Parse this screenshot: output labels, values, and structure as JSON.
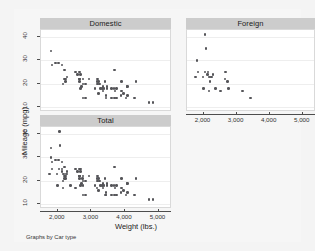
{
  "chart_data": {
    "type": "scatter",
    "title": "",
    "xlabel": "Weight (lbs.)",
    "ylabel": "Mileage (mpg)",
    "note": "Graphs by Car type",
    "xlim": [
      1500,
      5400
    ],
    "ylim": [
      8,
      43
    ],
    "xticks": [
      2000,
      3000,
      4000,
      5000
    ],
    "xticklabels": [
      "2,000",
      "3,000",
      "4,000",
      "5,000"
    ],
    "yticks": [
      10,
      20,
      30,
      40
    ],
    "yticklabels": [
      "10",
      "20",
      "30",
      "40"
    ],
    "grid": "horizontal",
    "legend": "none",
    "marker_color": "#555559",
    "panel_header_color": "#cccccc",
    "plot_background": "#ffffff",
    "graph_background": "#f6f6f6",
    "panels": [
      {
        "label": "Domestic",
        "points": [
          [
            2930,
            22
          ],
          [
            3350,
            17
          ],
          [
            2640,
            22
          ],
          [
            3250,
            20
          ],
          [
            4080,
            15
          ],
          [
            3670,
            18
          ],
          [
            3690,
            26
          ],
          [
            3180,
            20
          ],
          [
            3220,
            16
          ],
          [
            4060,
            19
          ],
          [
            3600,
            14
          ],
          [
            3740,
            14
          ],
          [
            4840,
            12
          ],
          [
            4720,
            12
          ],
          [
            3430,
            15
          ],
          [
            3280,
            18
          ],
          [
            2750,
            14
          ],
          [
            3430,
            14
          ],
          [
            3210,
            21
          ],
          [
            2020,
            29
          ],
          [
            2280,
            23
          ],
          [
            2750,
            20
          ],
          [
            3170,
            21
          ],
          [
            2710,
            19
          ],
          [
            2200,
            22
          ],
          [
            2670,
            24
          ],
          [
            3690,
            14
          ],
          [
            3400,
            21
          ],
          [
            2520,
            25
          ],
          [
            3330,
            18
          ],
          [
            3370,
            18
          ],
          [
            3600,
            18
          ],
          [
            3740,
            18
          ],
          [
            3700,
            17
          ],
          [
            3950,
            16
          ],
          [
            3470,
            18
          ],
          [
            2830,
            14
          ],
          [
            2640,
            22
          ],
          [
            2230,
            21
          ],
          [
            2130,
            28
          ],
          [
            2650,
            25
          ],
          [
            2750,
            22
          ],
          [
            3470,
            19
          ],
          [
            3880,
            15
          ],
          [
            3900,
            17
          ],
          [
            4290,
            14
          ],
          [
            4030,
            14
          ],
          [
            3180,
            22
          ],
          [
            2830,
            20
          ],
          [
            2200,
            26
          ],
          [
            1800,
            34
          ],
          [
            2670,
            18
          ],
          [
            3900,
            21
          ],
          [
            4330,
            21
          ],
          [
            2160,
            20
          ],
          [
            2580,
            24
          ],
          [
            1930,
            29
          ],
          [
            1830,
            28
          ],
          [
            3110,
            18
          ],
          [
            4070,
            19
          ],
          [
            2230,
            22
          ],
          [
            2640,
            21
          ],
          [
            3350,
            19
          ]
        ]
      },
      {
        "label": "Foreign",
        "points": [
          [
            2070,
            35
          ],
          [
            2130,
            25
          ],
          [
            2650,
            22
          ],
          [
            2160,
            17
          ],
          [
            1760,
            23
          ],
          [
            2040,
            25
          ],
          [
            2050,
            41
          ],
          [
            1830,
            25
          ],
          [
            2200,
            21
          ],
          [
            2670,
            25
          ],
          [
            1990,
            18
          ],
          [
            2160,
            23
          ],
          [
            2370,
            18
          ],
          [
            2280,
            24
          ],
          [
            2750,
            18
          ],
          [
            2120,
            24
          ],
          [
            2240,
            23
          ],
          [
            2520,
            17
          ],
          [
            1980,
            23
          ],
          [
            1800,
            30
          ],
          [
            3170,
            17
          ],
          [
            2190,
            23
          ],
          [
            3420,
            14
          ],
          [
            2730,
            21
          ]
        ]
      },
      {
        "label": "Total",
        "points": [
          [
            2930,
            22
          ],
          [
            3350,
            17
          ],
          [
            2640,
            22
          ],
          [
            3250,
            20
          ],
          [
            4080,
            15
          ],
          [
            3670,
            18
          ],
          [
            3690,
            26
          ],
          [
            3180,
            20
          ],
          [
            3220,
            16
          ],
          [
            4060,
            19
          ],
          [
            3600,
            14
          ],
          [
            3740,
            14
          ],
          [
            4840,
            12
          ],
          [
            4720,
            12
          ],
          [
            3430,
            15
          ],
          [
            3280,
            18
          ],
          [
            2750,
            14
          ],
          [
            3430,
            14
          ],
          [
            3210,
            21
          ],
          [
            2020,
            29
          ],
          [
            2280,
            23
          ],
          [
            2750,
            20
          ],
          [
            3170,
            21
          ],
          [
            2710,
            19
          ],
          [
            2200,
            22
          ],
          [
            2670,
            24
          ],
          [
            3690,
            14
          ],
          [
            3400,
            21
          ],
          [
            2520,
            25
          ],
          [
            3330,
            18
          ],
          [
            3370,
            18
          ],
          [
            3600,
            18
          ],
          [
            3740,
            18
          ],
          [
            3700,
            17
          ],
          [
            3950,
            16
          ],
          [
            3470,
            18
          ],
          [
            2830,
            14
          ],
          [
            2640,
            22
          ],
          [
            2230,
            21
          ],
          [
            2130,
            28
          ],
          [
            2650,
            25
          ],
          [
            2750,
            22
          ],
          [
            3470,
            19
          ],
          [
            3880,
            15
          ],
          [
            3900,
            17
          ],
          [
            4290,
            14
          ],
          [
            4030,
            14
          ],
          [
            3180,
            22
          ],
          [
            2830,
            20
          ],
          [
            2200,
            26
          ],
          [
            1800,
            34
          ],
          [
            2670,
            18
          ],
          [
            3900,
            21
          ],
          [
            4330,
            21
          ],
          [
            2160,
            20
          ],
          [
            2580,
            24
          ],
          [
            1930,
            29
          ],
          [
            1830,
            28
          ],
          [
            3110,
            18
          ],
          [
            4070,
            19
          ],
          [
            2230,
            22
          ],
          [
            2640,
            21
          ],
          [
            3350,
            19
          ],
          [
            2070,
            35
          ],
          [
            2130,
            25
          ],
          [
            2650,
            22
          ],
          [
            2160,
            17
          ],
          [
            1760,
            23
          ],
          [
            2040,
            25
          ],
          [
            2050,
            41
          ],
          [
            1830,
            25
          ],
          [
            2200,
            21
          ],
          [
            2670,
            25
          ],
          [
            1990,
            18
          ],
          [
            2160,
            23
          ],
          [
            2370,
            18
          ],
          [
            2280,
            24
          ],
          [
            2750,
            18
          ],
          [
            2120,
            24
          ],
          [
            2240,
            23
          ],
          [
            2520,
            17
          ],
          [
            1980,
            23
          ],
          [
            1800,
            30
          ],
          [
            3170,
            17
          ],
          [
            2190,
            23
          ],
          [
            3420,
            14
          ],
          [
            2730,
            21
          ]
        ]
      }
    ]
  },
  "layout": {
    "panels": [
      {
        "key": "Domestic",
        "x": 26,
        "y": 9,
        "w": 131,
        "h": 95,
        "plot_top": 11,
        "plot_h": 82,
        "show_y": true,
        "show_x": false
      },
      {
        "key": "Foreign",
        "x": 172,
        "y": 9,
        "w": 129,
        "h": 95,
        "plot_top": 11,
        "plot_h": 82,
        "show_y": false,
        "show_x": true
      },
      {
        "key": "Total",
        "x": 26,
        "y": 106,
        "w": 131,
        "h": 95,
        "plot_top": 11,
        "plot_h": 82,
        "show_y": true,
        "show_x": true
      }
    ]
  }
}
